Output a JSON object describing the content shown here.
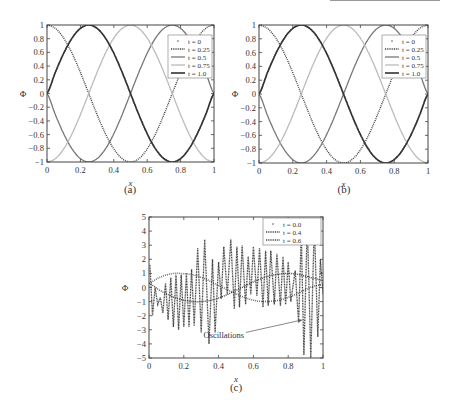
{
  "figure": {
    "panels": [
      {
        "id": "a",
        "caption": "(a)",
        "xlabel": "x",
        "ylabel": "Φ"
      },
      {
        "id": "b",
        "caption": "(b)",
        "xlabel": "x",
        "ylabel": "Φ"
      },
      {
        "id": "c",
        "caption": "(c)",
        "xlabel": "x",
        "ylabel": "Φ",
        "annotation": "Oscillations"
      }
    ]
  },
  "chart_data": [
    {
      "type": "line",
      "panel": "(a)",
      "title": "",
      "xlabel": "x",
      "ylabel": "Φ",
      "xlim": [
        0,
        1
      ],
      "ylim": [
        -1,
        1
      ],
      "xticks": [
        0,
        0.2,
        0.4,
        0.6,
        0.8,
        1
      ],
      "xtick_labels": [
        "0",
        "0.2",
        "0.4",
        "0.6",
        "0.8",
        "1"
      ],
      "yticks": [
        -1,
        -0.8,
        -0.6,
        -0.4,
        -0.2,
        0,
        0.2,
        0.4,
        0.6,
        0.8,
        1
      ],
      "ytick_labels": [
        "−1",
        "−0.8",
        "−0.6",
        "−0.4",
        "−0.2",
        "0",
        "0.2",
        "0.4",
        "0.6",
        "0.8",
        "1"
      ],
      "grid": false,
      "legend_position": "upper right",
      "x": [
        0,
        0.05,
        0.1,
        0.15,
        0.2,
        0.25,
        0.3,
        0.35,
        0.4,
        0.45,
        0.5,
        0.55,
        0.6,
        0.65,
        0.7,
        0.75,
        0.8,
        0.85,
        0.9,
        0.95,
        1
      ],
      "series": [
        {
          "name": "t = 0",
          "style": "markers",
          "color": "#555555",
          "values": [
            0,
            0.309,
            0.588,
            0.809,
            0.951,
            1,
            0.951,
            0.809,
            0.588,
            0.309,
            0,
            -0.309,
            -0.588,
            -0.809,
            -0.951,
            -1,
            -0.951,
            -0.809,
            -0.588,
            -0.309,
            0
          ]
        },
        {
          "name": "t = 0.25",
          "style": "dotted",
          "color": "#444444",
          "values": [
            1,
            0.951,
            0.809,
            0.588,
            0.309,
            0,
            -0.309,
            -0.588,
            -0.809,
            -0.951,
            -1,
            -0.951,
            -0.809,
            -0.588,
            -0.309,
            0,
            0.309,
            0.588,
            0.809,
            0.951,
            1
          ]
        },
        {
          "name": "t = 0.5",
          "style": "solid",
          "color": "#777777",
          "values": [
            0,
            -0.309,
            -0.588,
            -0.809,
            -0.951,
            -1,
            -0.951,
            -0.809,
            -0.588,
            -0.309,
            0,
            0.309,
            0.588,
            0.809,
            0.951,
            1,
            0.951,
            0.809,
            0.588,
            0.309,
            0
          ]
        },
        {
          "name": "t = 0.75",
          "style": "solid",
          "color": "#bbbbbb",
          "values": [
            -1,
            -0.951,
            -0.809,
            -0.588,
            -0.309,
            0,
            0.309,
            0.588,
            0.809,
            0.951,
            1,
            0.951,
            0.809,
            0.588,
            0.309,
            0,
            -0.309,
            -0.588,
            -0.809,
            -0.951,
            -1
          ]
        },
        {
          "name": "t = 1.0",
          "style": "solid-thick",
          "color": "#333333",
          "values": [
            0,
            0.309,
            0.588,
            0.809,
            0.951,
            1,
            0.951,
            0.809,
            0.588,
            0.309,
            0,
            -0.309,
            -0.588,
            -0.809,
            -0.951,
            -1,
            -0.951,
            -0.809,
            -0.588,
            -0.309,
            0
          ]
        }
      ]
    },
    {
      "type": "line",
      "panel": "(b)",
      "title": "",
      "xlabel": "x",
      "ylabel": "Φ",
      "xlim": [
        0,
        1
      ],
      "ylim": [
        -1,
        1
      ],
      "xticks": [
        0,
        0.2,
        0.4,
        0.6,
        0.8,
        1
      ],
      "xtick_labels": [
        "0",
        "0.2",
        "0.4",
        "0.6",
        "0.8",
        "1"
      ],
      "yticks": [
        -1,
        -0.8,
        -0.6,
        -0.4,
        -0.2,
        0,
        0.2,
        0.4,
        0.6,
        0.8,
        1
      ],
      "ytick_labels": [
        "−1",
        "−0.8",
        "−0.6",
        "−0.4",
        "−0.2",
        "0",
        "0.2",
        "0.4",
        "0.6",
        "0.8",
        "1"
      ],
      "grid": false,
      "legend_position": "upper right",
      "x": [
        0,
        0.05,
        0.1,
        0.15,
        0.2,
        0.25,
        0.3,
        0.35,
        0.4,
        0.45,
        0.5,
        0.55,
        0.6,
        0.65,
        0.7,
        0.75,
        0.8,
        0.85,
        0.9,
        0.95,
        1
      ],
      "series": [
        {
          "name": "t = 0",
          "style": "markers",
          "color": "#555555",
          "values": [
            0,
            0.309,
            0.588,
            0.809,
            0.951,
            1,
            0.951,
            0.809,
            0.588,
            0.309,
            0,
            -0.309,
            -0.588,
            -0.809,
            -0.951,
            -1,
            -0.951,
            -0.809,
            -0.588,
            -0.309,
            0
          ]
        },
        {
          "name": "t = 0.25",
          "style": "dotted",
          "color": "#444444",
          "values": [
            1,
            0.951,
            0.809,
            0.588,
            0.309,
            0,
            -0.309,
            -0.588,
            -0.809,
            -0.951,
            -1,
            -0.951,
            -0.809,
            -0.588,
            -0.309,
            0,
            0.309,
            0.588,
            0.809,
            0.951,
            1
          ]
        },
        {
          "name": "t = 0.5",
          "style": "solid",
          "color": "#777777",
          "values": [
            0,
            -0.309,
            -0.588,
            -0.809,
            -0.951,
            -1,
            -0.951,
            -0.809,
            -0.588,
            -0.309,
            0,
            0.309,
            0.588,
            0.809,
            0.951,
            1,
            0.951,
            0.809,
            0.588,
            0.309,
            0
          ]
        },
        {
          "name": "t = 0.75",
          "style": "solid",
          "color": "#bbbbbb",
          "values": [
            -1,
            -0.951,
            -0.809,
            -0.588,
            -0.309,
            0,
            0.309,
            0.588,
            0.809,
            0.951,
            1,
            0.951,
            0.809,
            0.588,
            0.309,
            0,
            -0.309,
            -0.588,
            -0.809,
            -0.951,
            -1
          ]
        },
        {
          "name": "t = 1.0",
          "style": "solid-thick",
          "color": "#333333",
          "values": [
            0,
            0.309,
            0.588,
            0.809,
            0.951,
            1,
            0.951,
            0.809,
            0.588,
            0.309,
            0,
            -0.309,
            -0.588,
            -0.809,
            -0.951,
            -1,
            -0.951,
            -0.809,
            -0.588,
            -0.309,
            0
          ]
        }
      ]
    },
    {
      "type": "line",
      "panel": "(c)",
      "title": "",
      "xlabel": "x",
      "ylabel": "Φ",
      "xlim": [
        0,
        1
      ],
      "ylim": [
        -5,
        5
      ],
      "xticks": [
        0,
        0.2,
        0.4,
        0.6,
        0.8,
        1
      ],
      "xtick_labels": [
        "0",
        "0.2",
        "0.4",
        "0.6",
        "0.8",
        "1"
      ],
      "yticks": [
        -5,
        -4,
        -3,
        -2,
        -1,
        0,
        1,
        2,
        3,
        4,
        5
      ],
      "ytick_labels": [
        "−5",
        "−4",
        "−3",
        "−2",
        "−1",
        "0",
        "1",
        "2",
        "3",
        "4",
        "5"
      ],
      "grid": false,
      "legend_position": "upper right",
      "annotations": [
        {
          "text": "Oscillations",
          "xy": [
            0.88,
            -2.3
          ],
          "xytext": [
            0.43,
            -3.4
          ]
        }
      ],
      "x": [
        0,
        0.05,
        0.1,
        0.15,
        0.2,
        0.25,
        0.3,
        0.35,
        0.4,
        0.45,
        0.5,
        0.55,
        0.6,
        0.65,
        0.7,
        0.75,
        0.8,
        0.85,
        0.9,
        0.95,
        1
      ],
      "series": [
        {
          "name": "t = 0.0",
          "style": "markers",
          "color": "#555555",
          "values": [
            0.3,
            0.65,
            0.9,
            1.0,
            0.98,
            0.9,
            0.72,
            0.45,
            0.15,
            -0.15,
            -0.45,
            -0.72,
            -0.9,
            -1.0,
            -0.98,
            -0.9,
            -0.7,
            -0.45,
            -0.15,
            0.1,
            0.2
          ]
        },
        {
          "name": "t = 0.4",
          "style": "dotted",
          "color": "#444444",
          "values": [
            0.3,
            -0.1,
            -0.45,
            -0.72,
            -0.9,
            -1.0,
            -1.0,
            -0.92,
            -0.75,
            -0.5,
            -0.2,
            0.1,
            0.4,
            0.65,
            0.85,
            0.95,
            1.0,
            0.95,
            0.8,
            0.65,
            0.5
          ]
        },
        {
          "name": "t = 0.6",
          "style": "dotted-oscillating",
          "color": "#444444",
          "peaks": [
            [
              0.005,
              1.6
            ],
            [
              0.02,
              -2.0
            ],
            [
              0.035,
              0.0
            ],
            [
              0.05,
              -1.2
            ],
            [
              0.065,
              -0.7
            ],
            [
              0.08,
              -1.8
            ],
            [
              0.095,
              0.3
            ],
            [
              0.11,
              -2.3
            ],
            [
              0.125,
              0.7
            ],
            [
              0.14,
              -2.8
            ],
            [
              0.155,
              0.9
            ],
            [
              0.17,
              -3.0
            ],
            [
              0.185,
              0.9
            ],
            [
              0.2,
              -2.8
            ],
            [
              0.215,
              1.0
            ],
            [
              0.23,
              -2.8
            ],
            [
              0.245,
              1.3
            ],
            [
              0.26,
              -2.7
            ],
            [
              0.28,
              2.8
            ],
            [
              0.3,
              -3.2
            ],
            [
              0.32,
              3.4
            ],
            [
              0.345,
              -4.0
            ],
            [
              0.365,
              2.0
            ],
            [
              0.38,
              -3.2
            ],
            [
              0.4,
              1.8
            ],
            [
              0.415,
              -0.8
            ],
            [
              0.43,
              2.9
            ],
            [
              0.45,
              -0.5
            ],
            [
              0.47,
              3.4
            ],
            [
              0.49,
              -1.5
            ],
            [
              0.505,
              2.9
            ],
            [
              0.52,
              -1.4
            ],
            [
              0.535,
              3.0
            ],
            [
              0.555,
              -1.2
            ],
            [
              0.57,
              2.2
            ],
            [
              0.585,
              -0.5
            ],
            [
              0.6,
              2.9
            ],
            [
              0.62,
              -0.6
            ],
            [
              0.635,
              2.8
            ],
            [
              0.655,
              -1.4
            ],
            [
              0.67,
              2.6
            ],
            [
              0.685,
              -1.3
            ],
            [
              0.7,
              2.6
            ],
            [
              0.72,
              -1.2
            ],
            [
              0.735,
              2.4
            ],
            [
              0.755,
              -1.3
            ],
            [
              0.77,
              2.2
            ],
            [
              0.785,
              -1.2
            ],
            [
              0.8,
              1.8
            ],
            [
              0.815,
              -1.0
            ],
            [
              0.84,
              1.2
            ],
            [
              0.86,
              -2.5
            ],
            [
              0.875,
              3.8
            ],
            [
              0.89,
              -4.8
            ],
            [
              0.91,
              4.6
            ],
            [
              0.93,
              -5.0
            ],
            [
              0.95,
              4.5
            ],
            [
              0.97,
              -3.5
            ],
            [
              0.985,
              2.0
            ],
            [
              1.0,
              -0.5
            ]
          ]
        }
      ]
    }
  ]
}
